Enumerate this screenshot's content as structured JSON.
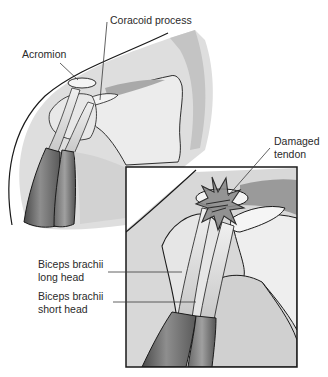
{
  "figure": {
    "labels": {
      "coracoid_process": "Coracoid process",
      "acromion": "Acromion",
      "damaged_tendon": [
        "Damaged",
        "tendon"
      ],
      "biceps_long_head": [
        "Biceps brachii",
        "long head"
      ],
      "biceps_short_head": [
        "Biceps brachii",
        "short head"
      ]
    },
    "icons": {
      "damage_marker": "starburst-icon"
    },
    "colors": {
      "outline": "#1a1a1a",
      "skin_light": "#e6e6e6",
      "skin_mid": "#cfcfcf",
      "skin_dark": "#b4b4b4",
      "bone": "#f2f2f2",
      "muscle_dark": "#5e5e5e",
      "muscle_mid": "#8a8a8a",
      "tendon": "#dcdcdc",
      "leader_line": "#3a3a3a"
    }
  }
}
